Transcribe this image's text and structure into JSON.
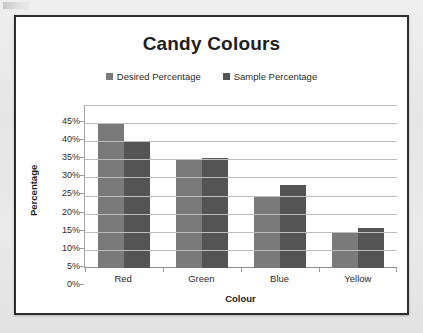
{
  "chart_data": {
    "type": "bar",
    "title": "Candy Colours",
    "xlabel": "Colour",
    "ylabel": "Percentage",
    "categories": [
      "Red",
      "Green",
      "Blue",
      "Yellow"
    ],
    "series": [
      {
        "name": "Desired Percentage",
        "values": [
          40,
          30,
          20,
          10
        ],
        "color": "#7a7a7a"
      },
      {
        "name": "Sample Percentage",
        "values": [
          35,
          30.5,
          23,
          11
        ],
        "color": "#545454"
      }
    ],
    "ylim": [
      0,
      45
    ],
    "ytick_step": 5,
    "ytick_labels": [
      "45%",
      "40%",
      "35%",
      "30%",
      "25%",
      "20%",
      "15%",
      "10%",
      "5%",
      "0%"
    ],
    "ytick_values": [
      45,
      40,
      35,
      30,
      25,
      20,
      15,
      10,
      5,
      0
    ],
    "grid": true,
    "legend_position": "top"
  },
  "frame": {
    "border_color": "#2e2e2e",
    "background": "#ffffff",
    "page_background": "#e9e9e9"
  }
}
